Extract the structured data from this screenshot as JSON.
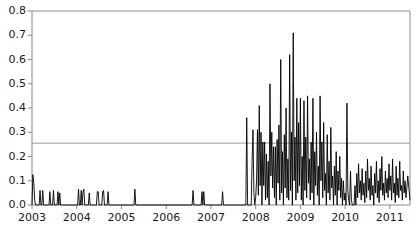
{
  "chart_data": {
    "type": "line",
    "title": "",
    "xlabel": "",
    "ylabel": "",
    "xlim": [
      2003.0,
      2011.45
    ],
    "ylim": [
      0.0,
      0.8
    ],
    "grid": false,
    "legend": null,
    "axis": {
      "y_ticks": [
        0.0,
        0.1,
        0.2,
        0.3,
        0.4,
        0.5,
        0.6,
        0.7,
        0.8
      ],
      "y_tick_labels": [
        "0.0",
        "0.1",
        "0.2",
        "0.3",
        "0.4",
        "0.5",
        "0.6",
        "0.7",
        "0.8"
      ],
      "x_ticks": [
        2003,
        2004,
        2005,
        2006,
        2007,
        2008,
        2009,
        2010,
        2011
      ],
      "x_tick_labels": [
        "2003",
        "2004",
        "2005",
        "2006",
        "2007",
        "2008",
        "2009",
        "2010",
        "2011"
      ]
    },
    "annotations": [
      {
        "type": "hline",
        "value": 0.255,
        "color": "#999999",
        "label": ""
      }
    ],
    "series": [
      {
        "name": "series-1",
        "color": "#000000",
        "x": [
          2003.0,
          2003.02,
          2003.04,
          2003.06,
          2003.08,
          2003.1,
          2003.12,
          2003.14,
          2003.16,
          2003.18,
          2003.2,
          2003.22,
          2003.24,
          2003.26,
          2003.28,
          2003.3,
          2003.32,
          2003.34,
          2003.36,
          2003.38,
          2003.4,
          2003.42,
          2003.44,
          2003.46,
          2003.48,
          2003.5,
          2003.52,
          2003.54,
          2003.56,
          2003.58,
          2003.6,
          2003.62,
          2003.64,
          2003.66,
          2003.68,
          2003.7,
          2003.72,
          2003.74,
          2003.76,
          2003.78,
          2003.8,
          2003.82,
          2003.84,
          2003.86,
          2003.88,
          2003.9,
          2003.92,
          2003.94,
          2003.96,
          2003.98,
          2004.0,
          2004.02,
          2004.04,
          2004.06,
          2004.08,
          2004.1,
          2004.12,
          2004.14,
          2004.16,
          2004.18,
          2004.2,
          2004.22,
          2004.24,
          2004.26,
          2004.28,
          2004.3,
          2004.32,
          2004.34,
          2004.36,
          2004.38,
          2004.4,
          2004.42,
          2004.44,
          2004.46,
          2004.48,
          2004.5,
          2004.52,
          2004.54,
          2004.56,
          2004.58,
          2004.6,
          2004.62,
          2004.64,
          2004.66,
          2004.68,
          2004.7,
          2004.72,
          2004.74,
          2004.76,
          2004.78,
          2004.8,
          2004.82,
          2004.84,
          2004.86,
          2004.88,
          2004.9,
          2004.92,
          2004.94,
          2004.96,
          2004.98,
          2005.0,
          2005.05,
          2005.1,
          2005.15,
          2005.2,
          2005.25,
          2005.26,
          2005.28,
          2005.3,
          2005.32,
          2005.34,
          2005.36,
          2005.4,
          2005.45,
          2005.5,
          2005.55,
          2005.6,
          2005.65,
          2005.7,
          2005.75,
          2005.8,
          2005.85,
          2005.9,
          2005.95,
          2006.0,
          2006.05,
          2006.1,
          2006.15,
          2006.2,
          2006.25,
          2006.3,
          2006.35,
          2006.4,
          2006.45,
          2006.5,
          2006.55,
          2006.58,
          2006.6,
          2006.62,
          2006.64,
          2006.66,
          2006.7,
          2006.75,
          2006.78,
          2006.8,
          2006.82,
          2006.84,
          2006.86,
          2006.88,
          2006.9,
          2006.92,
          2006.94,
          2006.96,
          2006.98,
          2007.0,
          2007.02,
          2007.04,
          2007.06,
          2007.08,
          2007.1,
          2007.12,
          2007.14,
          2007.16,
          2007.18,
          2007.2,
          2007.22,
          2007.24,
          2007.26,
          2007.28,
          2007.3,
          2007.32,
          2007.34,
          2007.36,
          2007.38,
          2007.4,
          2007.42,
          2007.44,
          2007.46,
          2007.48,
          2007.5,
          2007.52,
          2007.54,
          2007.56,
          2007.58,
          2007.6,
          2007.62,
          2007.64,
          2007.66,
          2007.68,
          2007.7,
          2007.72,
          2007.74,
          2007.76,
          2007.78,
          2007.8,
          2007.82,
          2007.84,
          2007.86,
          2007.88,
          2007.9,
          2007.92,
          2007.94,
          2007.96,
          2007.98,
          2008.0,
          2008.02,
          2008.04,
          2008.06,
          2008.08,
          2008.1,
          2008.12,
          2008.14,
          2008.16,
          2008.18,
          2008.2,
          2008.22,
          2008.24,
          2008.26,
          2008.28,
          2008.3,
          2008.32,
          2008.34,
          2008.36,
          2008.38,
          2008.4,
          2008.42,
          2008.44,
          2008.46,
          2008.48,
          2008.5,
          2008.52,
          2008.54,
          2008.56,
          2008.58,
          2008.6,
          2008.62,
          2008.64,
          2008.66,
          2008.68,
          2008.7,
          2008.72,
          2008.74,
          2008.76,
          2008.78,
          2008.8,
          2008.82,
          2008.84,
          2008.86,
          2008.88,
          2008.9,
          2008.92,
          2008.94,
          2008.96,
          2008.98,
          2009.0,
          2009.02,
          2009.04,
          2009.06,
          2009.08,
          2009.1,
          2009.12,
          2009.14,
          2009.16,
          2009.18,
          2009.2,
          2009.22,
          2009.24,
          2009.26,
          2009.28,
          2009.3,
          2009.32,
          2009.34,
          2009.36,
          2009.38,
          2009.4,
          2009.42,
          2009.44,
          2009.46,
          2009.48,
          2009.5,
          2009.52,
          2009.54,
          2009.56,
          2009.58,
          2009.6,
          2009.62,
          2009.64,
          2009.66,
          2009.68,
          2009.7,
          2009.72,
          2009.74,
          2009.76,
          2009.78,
          2009.8,
          2009.82,
          2009.84,
          2009.86,
          2009.88,
          2009.9,
          2009.92,
          2009.94,
          2009.96,
          2009.98,
          2010.0,
          2010.02,
          2010.04,
          2010.06,
          2010.08,
          2010.1,
          2010.12,
          2010.14,
          2010.16,
          2010.18,
          2010.2,
          2010.22,
          2010.24,
          2010.26,
          2010.28,
          2010.3,
          2010.32,
          2010.34,
          2010.36,
          2010.38,
          2010.4,
          2010.42,
          2010.44,
          2010.46,
          2010.48,
          2010.5,
          2010.52,
          2010.54,
          2010.56,
          2010.58,
          2010.6,
          2010.62,
          2010.64,
          2010.66,
          2010.68,
          2010.7,
          2010.72,
          2010.74,
          2010.76,
          2010.78,
          2010.8,
          2010.82,
          2010.84,
          2010.86,
          2010.88,
          2010.9,
          2010.92,
          2010.94,
          2010.96,
          2010.98,
          2011.0,
          2011.02,
          2011.04,
          2011.06,
          2011.08,
          2011.1,
          2011.12,
          2011.14,
          2011.16,
          2011.18,
          2011.2,
          2011.22,
          2011.24,
          2011.26,
          2011.28,
          2011.3,
          2011.32,
          2011.34,
          2011.36,
          2011.38,
          2011.4,
          2011.45
        ],
        "y": [
          0.0,
          0.125,
          0.09,
          0.02,
          0.0,
          0.0,
          0.0,
          0.0,
          0.0,
          0.06,
          0.0,
          0.0,
          0.06,
          0.0,
          0.0,
          0.0,
          0.0,
          0.0,
          0.0,
          0.0,
          0.055,
          0.0,
          0.0,
          0.0,
          0.06,
          0.0,
          0.0,
          0.0,
          0.0,
          0.055,
          0.0,
          0.05,
          0.0,
          0.0,
          0.0,
          0.0,
          0.0,
          0.0,
          0.0,
          0.0,
          0.0,
          0.0,
          0.0,
          0.0,
          0.0,
          0.0,
          0.0,
          0.0,
          0.0,
          0.0,
          0.0,
          0.0,
          0.065,
          0.0,
          0.0,
          0.06,
          0.0,
          0.055,
          0.065,
          0.0,
          0.0,
          0.0,
          0.0,
          0.0,
          0.05,
          0.0,
          0.0,
          0.0,
          0.0,
          0.0,
          0.0,
          0.0,
          0.0,
          0.055,
          0.055,
          0.0,
          0.0,
          0.0,
          0.0,
          0.055,
          0.06,
          0.0,
          0.0,
          0.0,
          0.0,
          0.055,
          0.0,
          0.0,
          0.0,
          0.0,
          0.0,
          0.0,
          0.0,
          0.0,
          0.0,
          0.0,
          0.0,
          0.0,
          0.0,
          0.0,
          0.0,
          0.0,
          0.0,
          0.0,
          0.0,
          0.0,
          0.0,
          0.0,
          0.065,
          0.0,
          0.0,
          0.0,
          0.0,
          0.0,
          0.0,
          0.0,
          0.0,
          0.0,
          0.0,
          0.0,
          0.0,
          0.0,
          0.0,
          0.0,
          0.0,
          0.0,
          0.0,
          0.0,
          0.0,
          0.0,
          0.0,
          0.0,
          0.0,
          0.0,
          0.0,
          0.0,
          0.0,
          0.06,
          0.0,
          0.0,
          0.0,
          0.0,
          0.0,
          0.0,
          0.055,
          0.0,
          0.055,
          0.0,
          0.0,
          0.0,
          0.0,
          0.0,
          0.0,
          0.0,
          0.0,
          0.0,
          0.0,
          0.0,
          0.0,
          0.0,
          0.0,
          0.0,
          0.0,
          0.0,
          0.0,
          0.0,
          0.0,
          0.055,
          0.0,
          0.0,
          0.0,
          0.0,
          0.0,
          0.0,
          0.0,
          0.0,
          0.0,
          0.0,
          0.0,
          0.0,
          0.0,
          0.0,
          0.0,
          0.0,
          0.0,
          0.0,
          0.0,
          0.0,
          0.0,
          0.0,
          0.0,
          0.0,
          0.0,
          0.0,
          0.36,
          0.0,
          0.0,
          0.0,
          0.0,
          0.0,
          0.18,
          0.31,
          0.05,
          0.0,
          0.03,
          0.1,
          0.31,
          0.04,
          0.41,
          0.08,
          0.3,
          0.0,
          0.26,
          0.08,
          0.26,
          0.02,
          0.21,
          0.03,
          0.18,
          0.0,
          0.5,
          0.12,
          0.3,
          0.07,
          0.24,
          0.03,
          0.24,
          0.0,
          0.27,
          0.09,
          0.33,
          0.02,
          0.6,
          0.05,
          0.22,
          0.0,
          0.29,
          0.07,
          0.4,
          0.03,
          0.19,
          0.02,
          0.62,
          0.06,
          0.3,
          0.0,
          0.71,
          0.1,
          0.28,
          0.02,
          0.44,
          0.05,
          0.34,
          0.08,
          0.44,
          0.02,
          0.2,
          0.0,
          0.43,
          0.06,
          0.28,
          0.03,
          0.45,
          0.09,
          0.19,
          0.02,
          0.26,
          0.05,
          0.44,
          0.0,
          0.22,
          0.08,
          0.3,
          0.04,
          0.16,
          0.0,
          0.45,
          0.1,
          0.26,
          0.03,
          0.34,
          0.06,
          0.13,
          0.0,
          0.29,
          0.05,
          0.18,
          0.02,
          0.32,
          0.07,
          0.12,
          0.0,
          0.16,
          0.04,
          0.22,
          0.0,
          0.14,
          0.06,
          0.2,
          0.03,
          0.11,
          0.0,
          0.1,
          0.02,
          0.05,
          0.0,
          0.42,
          0.06,
          0.02,
          0.0,
          0.14,
          0.02,
          0.0,
          0.0,
          0.0,
          0.08,
          0.0,
          0.13,
          0.03,
          0.17,
          0.05,
          0.1,
          0.02,
          0.15,
          0.04,
          0.09,
          0.01,
          0.14,
          0.03,
          0.19,
          0.06,
          0.11,
          0.02,
          0.16,
          0.04,
          0.08,
          0.0,
          0.13,
          0.05,
          0.18,
          0.03,
          0.1,
          0.01,
          0.15,
          0.06,
          0.2,
          0.04,
          0.09,
          0.02,
          0.14,
          0.05,
          0.11,
          0.03,
          0.17,
          0.06,
          0.12,
          0.02,
          0.19,
          0.05,
          0.09,
          0.01,
          0.16,
          0.04,
          0.11,
          0.03,
          0.18,
          0.06,
          0.08,
          0.02,
          0.14,
          0.05,
          0.1,
          0.03,
          0.07,
          0.12,
          0.02
        ]
      }
    ]
  }
}
